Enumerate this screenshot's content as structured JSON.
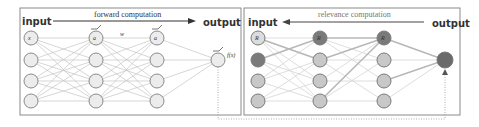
{
  "forward_panel": {
    "input_label": "input",
    "output_label": "output",
    "caption": "forward computation",
    "node_labels": {
      "x1": "x",
      "x1_sub": "1",
      "a1": "a",
      "a1_sub": "1",
      "an": "a",
      "an_sub": "n",
      "weight": "w",
      "weight_sub": "ik"
    },
    "output_node_label": "f(x)",
    "colors": {
      "frame": "#8a8a8a",
      "node_fill": "#ececec",
      "node_stroke": "#8a8a8a",
      "edge": "#c4c4c4"
    }
  },
  "relevance_panel": {
    "input_label": "input",
    "output_label": "output",
    "caption": "relevance computation",
    "node_labels": {
      "r1": "R",
      "r1_sub": "1",
      "rj": "R",
      "rj_sub": "j",
      "rk": "R",
      "rk_sub": "k"
    },
    "colors": {
      "frame": "#8a8a8a",
      "node_light": "#c8c8c8",
      "node_dark": "#7a7a7a",
      "node_highlight": "#dcdcdc",
      "edge": "#d4d4d4",
      "edge_strong": "#b8b8b8"
    }
  },
  "connector": {
    "style": "dotted",
    "color": "#9a9a9a"
  }
}
